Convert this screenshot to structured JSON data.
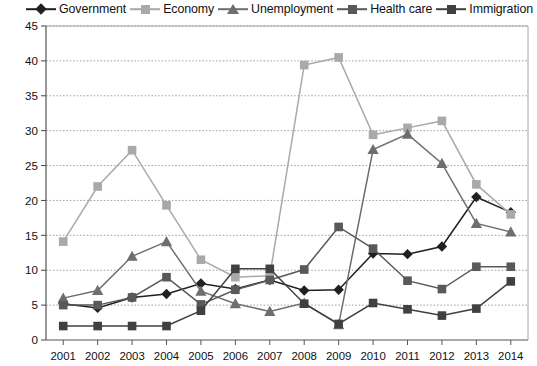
{
  "chart_data": {
    "type": "line",
    "title": "",
    "xlabel": "",
    "ylabel": "",
    "ylim": [
      0,
      45
    ],
    "ytick_step": 5,
    "grid": true,
    "legend_position": "top",
    "categories": [
      "2001",
      "2002",
      "2003",
      "2004",
      "2005",
      "2006",
      "2007",
      "2008",
      "2009",
      "2010",
      "2011",
      "2012",
      "2013",
      "2014"
    ],
    "series": [
      {
        "name": "Government",
        "marker": "diamond",
        "color": "#231f20",
        "values": [
          5.2,
          4.6,
          6.1,
          6.6,
          8.1,
          7.3,
          8.6,
          7.1,
          7.2,
          12.4,
          12.3,
          13.4,
          20.5,
          18.3
        ]
      },
      {
        "name": "Economy",
        "marker": "square",
        "color": "#a7a9ac",
        "values": [
          14.1,
          22.0,
          27.2,
          19.3,
          11.5,
          9.0,
          9.2,
          39.4,
          40.5,
          29.4,
          30.4,
          31.4,
          22.3,
          18.0
        ]
      },
      {
        "name": "Unemployment",
        "marker": "triangle",
        "color": "#6d6e71",
        "values": [
          6.0,
          7.1,
          12.0,
          14.1,
          7.0,
          5.2,
          4.1,
          5.3,
          2.2,
          27.3,
          29.5,
          25.3,
          16.7,
          15.5
        ]
      },
      {
        "name": "Health care",
        "marker": "square",
        "color": "#58595b",
        "values": [
          5.0,
          5.0,
          6.1,
          9.0,
          5.1,
          7.2,
          8.6,
          10.1,
          16.2,
          13.1,
          8.5,
          7.3,
          10.5,
          10.5
        ]
      },
      {
        "name": "Immigration",
        "marker": "square",
        "color": "#404041",
        "values": [
          2.0,
          2.0,
          2.0,
          2.0,
          4.2,
          10.2,
          10.2,
          5.2,
          2.3,
          5.3,
          4.4,
          3.5,
          4.5,
          8.4
        ]
      }
    ],
    "yticks": [
      "0",
      "5",
      "10",
      "15",
      "20",
      "25",
      "30",
      "35",
      "40",
      "45"
    ]
  }
}
